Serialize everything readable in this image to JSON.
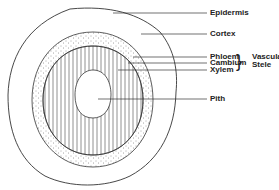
{
  "diagram": {
    "type": "cross-section",
    "colors": {
      "stroke": "#333333",
      "background": "#ffffff"
    },
    "labels": {
      "epidermis": "Epidermis",
      "cortex": "Cortex",
      "phloem": "Phloem",
      "cambium": "Cambium",
      "xylem": "Xylem",
      "pith": "Pith"
    },
    "group": {
      "line1": "Vascular",
      "line2": "Stele",
      "brace": "}"
    }
  }
}
